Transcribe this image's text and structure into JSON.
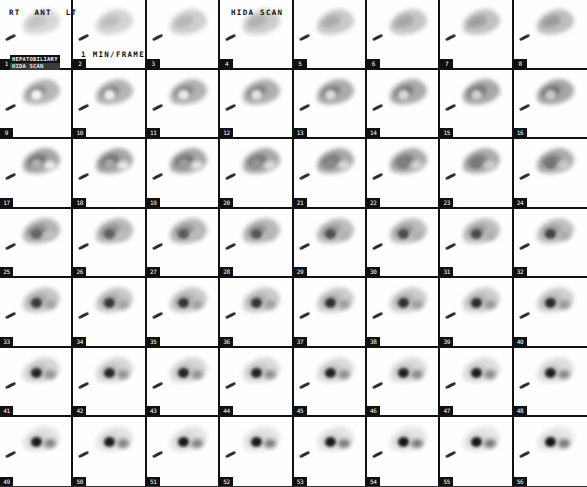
{
  "study": {
    "title": "HIDA SCAN",
    "frame_rate_label": "1 MIN/FRAME",
    "orientation_labels": [
      "RT",
      "ANT",
      "LT"
    ],
    "procedure_stamp": {
      "line1": "HEPATOBILIARY",
      "line2": "HIDA SCAN"
    },
    "grid": {
      "rows": 7,
      "columns": 8,
      "total_frames": 56
    },
    "colors": {
      "background": "#fdfdfd",
      "frame_border": "#111111",
      "tracer_uptake": "#1a1a1a",
      "label_text": "#111111",
      "stamp_background": "#111111"
    }
  },
  "frames": [
    {
      "number": "1",
      "liver": 0.3,
      "gallbladder": 0.0,
      "bowel": 0.0
    },
    {
      "number": "2",
      "liver": 0.33,
      "gallbladder": 0.0,
      "bowel": 0.0
    },
    {
      "number": "3",
      "liver": 0.36,
      "gallbladder": 0.0,
      "bowel": 0.0
    },
    {
      "number": "4",
      "liver": 0.39,
      "gallbladder": 0.0,
      "bowel": 0.0
    },
    {
      "number": "5",
      "liver": 0.42,
      "gallbladder": 0.0,
      "bowel": 0.0
    },
    {
      "number": "6",
      "liver": 0.45,
      "gallbladder": 0.0,
      "bowel": 0.0
    },
    {
      "number": "7",
      "liver": 0.48,
      "gallbladder": 0.0,
      "bowel": 0.0
    },
    {
      "number": "8",
      "liver": 0.5,
      "gallbladder": 0.0,
      "bowel": 0.0
    },
    {
      "number": "9",
      "liver": 0.56,
      "gallbladder": 0.05,
      "bowel": 0.0
    },
    {
      "number": "10",
      "liver": 0.58,
      "gallbladder": 0.08,
      "bowel": 0.0
    },
    {
      "number": "11",
      "liver": 0.6,
      "gallbladder": 0.1,
      "bowel": 0.0
    },
    {
      "number": "12",
      "liver": 0.62,
      "gallbladder": 0.13,
      "bowel": 0.0
    },
    {
      "number": "13",
      "liver": 0.64,
      "gallbladder": 0.16,
      "bowel": 0.0
    },
    {
      "number": "14",
      "liver": 0.66,
      "gallbladder": 0.18,
      "bowel": 0.0
    },
    {
      "number": "15",
      "liver": 0.68,
      "gallbladder": 0.21,
      "bowel": 0.0
    },
    {
      "number": "16",
      "liver": 0.7,
      "gallbladder": 0.24,
      "bowel": 0.0
    },
    {
      "number": "17",
      "liver": 0.7,
      "gallbladder": 0.34,
      "bowel": 0.1
    },
    {
      "number": "18",
      "liver": 0.7,
      "gallbladder": 0.38,
      "bowel": 0.13
    },
    {
      "number": "19",
      "liver": 0.69,
      "gallbladder": 0.42,
      "bowel": 0.16
    },
    {
      "number": "20",
      "liver": 0.68,
      "gallbladder": 0.46,
      "bowel": 0.19
    },
    {
      "number": "21",
      "liver": 0.67,
      "gallbladder": 0.5,
      "bowel": 0.22
    },
    {
      "number": "22",
      "liver": 0.66,
      "gallbladder": 0.54,
      "bowel": 0.25
    },
    {
      "number": "23",
      "liver": 0.65,
      "gallbladder": 0.57,
      "bowel": 0.28
    },
    {
      "number": "24",
      "liver": 0.64,
      "gallbladder": 0.6,
      "bowel": 0.31
    },
    {
      "number": "25",
      "liver": 0.58,
      "gallbladder": 0.66,
      "bowel": 0.38
    },
    {
      "number": "26",
      "liver": 0.56,
      "gallbladder": 0.68,
      "bowel": 0.4
    },
    {
      "number": "27",
      "liver": 0.55,
      "gallbladder": 0.7,
      "bowel": 0.42
    },
    {
      "number": "28",
      "liver": 0.54,
      "gallbladder": 0.72,
      "bowel": 0.44
    },
    {
      "number": "29",
      "liver": 0.52,
      "gallbladder": 0.74,
      "bowel": 0.46
    },
    {
      "number": "30",
      "liver": 0.51,
      "gallbladder": 0.76,
      "bowel": 0.48
    },
    {
      "number": "31",
      "liver": 0.5,
      "gallbladder": 0.78,
      "bowel": 0.5
    },
    {
      "number": "32",
      "liver": 0.49,
      "gallbladder": 0.8,
      "bowel": 0.52
    },
    {
      "number": "33",
      "liver": 0.44,
      "gallbladder": 0.84,
      "bowel": 0.56
    },
    {
      "number": "34",
      "liver": 0.43,
      "gallbladder": 0.85,
      "bowel": 0.57
    },
    {
      "number": "35",
      "liver": 0.42,
      "gallbladder": 0.86,
      "bowel": 0.58
    },
    {
      "number": "36",
      "liver": 0.41,
      "gallbladder": 0.87,
      "bowel": 0.59
    },
    {
      "number": "37",
      "liver": 0.4,
      "gallbladder": 0.88,
      "bowel": 0.6
    },
    {
      "number": "38",
      "liver": 0.39,
      "gallbladder": 0.89,
      "bowel": 0.61
    },
    {
      "number": "39",
      "liver": 0.38,
      "gallbladder": 0.9,
      "bowel": 0.62
    },
    {
      "number": "40",
      "liver": 0.37,
      "gallbladder": 0.91,
      "bowel": 0.63
    },
    {
      "number": "41",
      "liver": 0.32,
      "gallbladder": 0.93,
      "bowel": 0.66
    },
    {
      "number": "42",
      "liver": 0.31,
      "gallbladder": 0.93,
      "bowel": 0.67
    },
    {
      "number": "43",
      "liver": 0.3,
      "gallbladder": 0.94,
      "bowel": 0.68
    },
    {
      "number": "44",
      "liver": 0.29,
      "gallbladder": 0.94,
      "bowel": 0.69
    },
    {
      "number": "45",
      "liver": 0.28,
      "gallbladder": 0.95,
      "bowel": 0.7
    },
    {
      "number": "46",
      "liver": 0.27,
      "gallbladder": 0.95,
      "bowel": 0.71
    },
    {
      "number": "47",
      "liver": 0.26,
      "gallbladder": 0.96,
      "bowel": 0.72
    },
    {
      "number": "48",
      "liver": 0.25,
      "gallbladder": 0.96,
      "bowel": 0.73
    },
    {
      "number": "49",
      "liver": 0.22,
      "gallbladder": 0.97,
      "bowel": 0.76
    },
    {
      "number": "50",
      "liver": 0.21,
      "gallbladder": 0.97,
      "bowel": 0.77
    },
    {
      "number": "51",
      "liver": 0.21,
      "gallbladder": 0.98,
      "bowel": 0.78
    },
    {
      "number": "52",
      "liver": 0.2,
      "gallbladder": 0.98,
      "bowel": 0.79
    },
    {
      "number": "53",
      "liver": 0.2,
      "gallbladder": 0.98,
      "bowel": 0.8
    },
    {
      "number": "54",
      "liver": 0.19,
      "gallbladder": 0.99,
      "bowel": 0.81
    },
    {
      "number": "55",
      "liver": 0.19,
      "gallbladder": 0.99,
      "bowel": 0.82
    },
    {
      "number": "56",
      "liver": 0.18,
      "gallbladder": 0.99,
      "bowel": 0.83
    }
  ]
}
